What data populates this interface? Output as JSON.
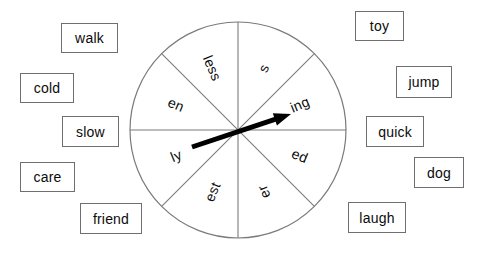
{
  "canvas": {
    "width": 481,
    "height": 257,
    "background": "#ffffff"
  },
  "wheel": {
    "name": "suffix-spinner-wheel",
    "center_x": 238,
    "center_y": 130,
    "radius": 108,
    "stroke_color": "#7a7a7a",
    "fill_color": "#ffffff",
    "segment_count": 8,
    "segments": [
      {
        "label": "s",
        "angle_deg": 292.5,
        "flipped": false
      },
      {
        "label": "ing",
        "angle_deg": 337.5,
        "flipped": false
      },
      {
        "label": "ed",
        "angle_deg": 22.5,
        "flipped": false
      },
      {
        "label": "er",
        "angle_deg": 67.5,
        "flipped": true
      },
      {
        "label": "est",
        "angle_deg": 112.5,
        "flipped": true
      },
      {
        "label": "ly",
        "angle_deg": 157.5,
        "flipped": true
      },
      {
        "label": "en",
        "angle_deg": 202.5,
        "flipped": true
      },
      {
        "label": "less",
        "angle_deg": 247.5,
        "flipped": true
      }
    ],
    "pointer": {
      "name": "spinner-arrow",
      "color": "#000000",
      "tail_x": 192,
      "tail_y": 147,
      "tip_x": 291,
      "tip_y": 114,
      "points_to": "ing"
    }
  },
  "word_cards": [
    {
      "text": "walk",
      "x": 61,
      "y": 23,
      "w": 57,
      "h": 30
    },
    {
      "text": "cold",
      "x": 20,
      "y": 73,
      "w": 54,
      "h": 30
    },
    {
      "text": "slow",
      "x": 62,
      "y": 116,
      "w": 57,
      "h": 31
    },
    {
      "text": "care",
      "x": 20,
      "y": 162,
      "w": 55,
      "h": 30
    },
    {
      "text": "friend",
      "x": 80,
      "y": 203,
      "w": 62,
      "h": 31
    },
    {
      "text": "toy",
      "x": 355,
      "y": 11,
      "w": 49,
      "h": 30
    },
    {
      "text": "jump",
      "x": 396,
      "y": 66,
      "w": 56,
      "h": 32
    },
    {
      "text": "quick",
      "x": 366,
      "y": 116,
      "w": 58,
      "h": 31
    },
    {
      "text": "dog",
      "x": 414,
      "y": 157,
      "w": 50,
      "h": 31
    },
    {
      "text": "laugh",
      "x": 348,
      "y": 202,
      "w": 58,
      "h": 31
    }
  ]
}
